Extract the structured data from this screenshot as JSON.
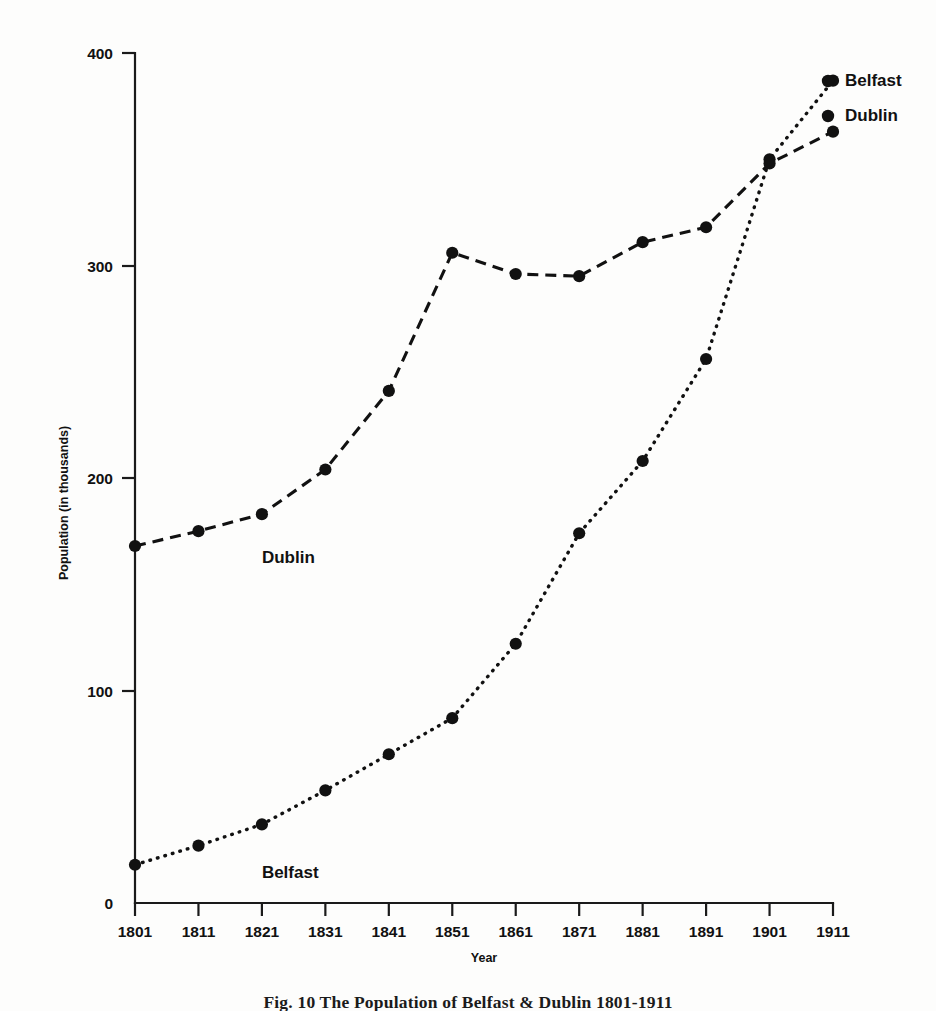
{
  "figure": {
    "background_color": "#fdfdfc",
    "ink_color": "#111111",
    "caption": "Fig. 10   The Population of Belfast & Dublin 1801-1911"
  },
  "chart_data": {
    "type": "line",
    "title": "",
    "xlabel": "Year",
    "ylabel": "Population (in thousands)",
    "x": [
      1801,
      1811,
      1821,
      1831,
      1841,
      1851,
      1861,
      1871,
      1881,
      1891,
      1901,
      1911
    ],
    "xtick_labels": [
      "1801",
      "1811",
      "1821",
      "1831",
      "1841",
      "1851",
      "1861",
      "1871",
      "1881",
      "1891",
      "1901",
      "1911"
    ],
    "ytick_labels": [
      "0",
      "100",
      "200",
      "300",
      "400"
    ],
    "yticks": [
      0,
      100,
      200,
      300,
      400
    ],
    "xlim": [
      1801,
      1911
    ],
    "ylim": [
      0,
      400
    ],
    "grid": false,
    "legend_position": "right-inline-end-of-line",
    "series": [
      {
        "name": "Belfast",
        "linestyle": "dotted",
        "marker": "circle",
        "color": "#111111",
        "values": [
          18,
          27,
          37,
          53,
          70,
          87,
          122,
          174,
          208,
          256,
          350,
          387
        ]
      },
      {
        "name": "Dublin",
        "linestyle": "dashed",
        "marker": "circle",
        "color": "#111111",
        "values": [
          168,
          175,
          183,
          204,
          241,
          306,
          296,
          295,
          311,
          318,
          348,
          363
        ]
      }
    ],
    "annotations": [
      {
        "text": "Dublin",
        "x": 1821,
        "y": 160
      },
      {
        "text": "Belfast",
        "x": 1821,
        "y": 12
      }
    ],
    "legend_entries": [
      {
        "label": "Belfast",
        "series": "Belfast"
      },
      {
        "label": "Dublin",
        "series": "Dublin"
      }
    ]
  }
}
